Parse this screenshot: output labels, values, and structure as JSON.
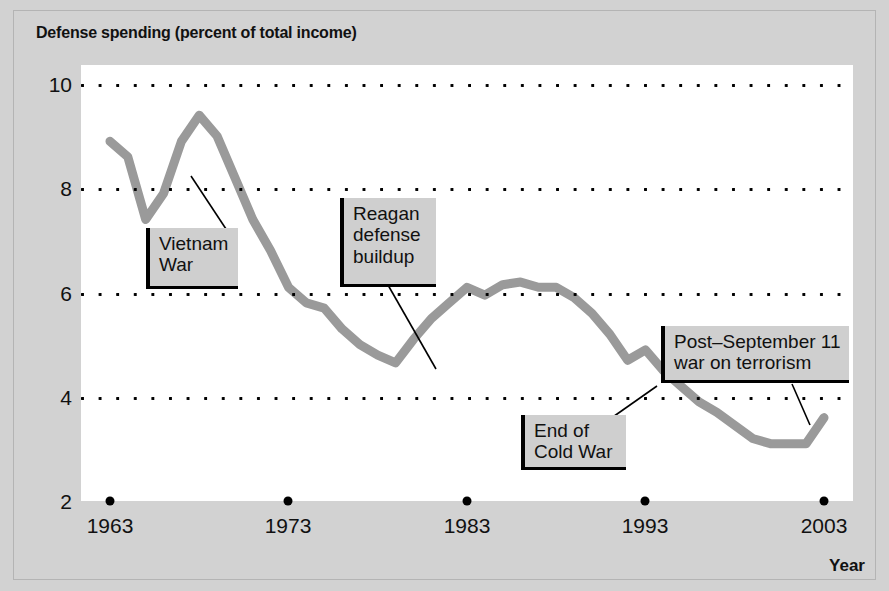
{
  "chart_data": {
    "type": "line",
    "title": "Defense spending (percent of total income)",
    "xlabel": "Year",
    "ylabel": "",
    "xlim": [
      1963,
      2003
    ],
    "ylim": [
      2,
      10
    ],
    "grid": true,
    "legend": "none",
    "line_color": "#9a9a9a",
    "x_ticks": [
      "1963",
      "1973",
      "1983",
      "1993",
      "2003"
    ],
    "y_ticks": [
      "10",
      "8",
      "6",
      "4",
      "2"
    ],
    "series": [
      {
        "name": "Defense spending (percent of total income)",
        "x": [
          1963,
          1964,
          1965,
          1966,
          1967,
          1968,
          1969,
          1970,
          1971,
          1972,
          1973,
          1974,
          1975,
          1976,
          1977,
          1978,
          1979,
          1980,
          1981,
          1982,
          1983,
          1984,
          1985,
          1986,
          1987,
          1988,
          1989,
          1990,
          1991,
          1992,
          1993,
          1994,
          1995,
          1996,
          1997,
          1998,
          1999,
          2000,
          2001,
          2002,
          2003
        ],
        "values": [
          8.9,
          8.6,
          7.4,
          7.9,
          8.9,
          9.4,
          9.0,
          8.2,
          7.4,
          6.8,
          6.1,
          5.8,
          5.7,
          5.3,
          5.0,
          4.8,
          4.65,
          5.1,
          5.5,
          5.8,
          6.1,
          5.95,
          6.15,
          6.2,
          6.1,
          6.1,
          5.9,
          5.6,
          5.2,
          4.7,
          4.9,
          4.5,
          4.2,
          3.9,
          3.7,
          3.45,
          3.2,
          3.1,
          3.1,
          3.1,
          3.6
        ]
      }
    ],
    "annotations": [
      {
        "id": "vietnam-war",
        "label": "Vietnam\nWar",
        "box": {
          "left": 146,
          "top": 228,
          "width": 92,
          "height": 61
        },
        "leader": {
          "x1": 228,
          "y1": 232,
          "x2": 191,
          "y2": 176
        }
      },
      {
        "id": "reagan-defense-buildup",
        "label": "Reagan\ndefense\nbuildup",
        "box": {
          "left": 340,
          "top": 198,
          "width": 96,
          "height": 89
        },
        "leader": {
          "x1": 388,
          "y1": 285,
          "x2": 436,
          "y2": 369
        }
      },
      {
        "id": "end-of-cold-war",
        "label": "End of\nCold War",
        "box": {
          "left": 521,
          "top": 415,
          "width": 105,
          "height": 55
        },
        "leader": {
          "x1": 610,
          "y1": 419,
          "x2": 657,
          "y2": 386
        }
      },
      {
        "id": "post-september-11-war-on-terrorism",
        "label": "Post–September 11\nwar on terrorism",
        "box": {
          "left": 661,
          "top": 326,
          "width": 188,
          "height": 57
        },
        "leader": {
          "x1": 792,
          "y1": 384,
          "x2": 810,
          "y2": 425
        }
      }
    ]
  }
}
